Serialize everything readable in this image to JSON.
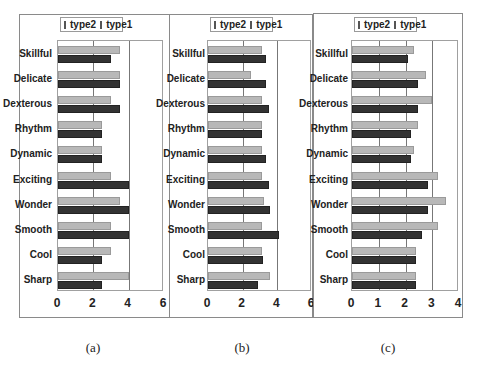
{
  "chart_data": [
    {
      "type": "bar",
      "orientation": "horizontal",
      "caption": "(a)",
      "categories": [
        "Skillful",
        "Delicate",
        "Dexterous",
        "Rhythm",
        "Dynamic",
        "Exciting",
        "Wonder",
        "Smooth",
        "Cool",
        "Sharp"
      ],
      "series": [
        {
          "name": "type2",
          "color": "#333333",
          "values": [
            3.0,
            3.5,
            3.5,
            2.5,
            2.5,
            4.0,
            4.0,
            4.0,
            2.5,
            2.5
          ]
        },
        {
          "name": "type1",
          "color": "#bdbdbd",
          "values": [
            3.5,
            3.5,
            3.0,
            2.5,
            2.5,
            3.0,
            3.5,
            3.0,
            3.0,
            4.0
          ]
        }
      ],
      "xlim": [
        0,
        6
      ],
      "xticks": [
        "0",
        "2",
        "4",
        "6"
      ],
      "legend": [
        "type2",
        "type1"
      ],
      "legend_position": "top",
      "grid": "vertical"
    },
    {
      "type": "bar",
      "orientation": "horizontal",
      "caption": "(b)",
      "categories": [
        "Skillful",
        "Delicate",
        "Dexterous",
        "Rhythm",
        "Dynamic",
        "Exciting",
        "Wonder",
        "Smooth",
        "Cool",
        "Sharp"
      ],
      "series": [
        {
          "name": "type2",
          "color": "#333333",
          "values": [
            3.35,
            3.35,
            3.5,
            3.1,
            3.35,
            3.5,
            3.6,
            4.1,
            3.2,
            2.9
          ]
        },
        {
          "name": "type1",
          "color": "#bdbdbd",
          "values": [
            3.1,
            2.5,
            3.1,
            3.1,
            3.1,
            3.1,
            3.25,
            3.1,
            3.1,
            3.6
          ]
        }
      ],
      "xlim": [
        0,
        6
      ],
      "xticks": [
        "0",
        "2",
        "4",
        "6"
      ],
      "legend": [
        "type2",
        "type1"
      ],
      "legend_position": "top",
      "grid": "vertical"
    },
    {
      "type": "bar",
      "orientation": "horizontal",
      "caption": "(c)",
      "categories": [
        "Skillful",
        "Delicate",
        "Dexterous",
        "Rhythm",
        "Dynamic",
        "Exciting",
        "Wonder",
        "Smooth",
        "Cool",
        "Sharp"
      ],
      "series": [
        {
          "name": "type2",
          "color": "#333333",
          "values": [
            2.1,
            2.45,
            2.45,
            2.2,
            2.2,
            2.85,
            2.85,
            2.6,
            2.4,
            2.4
          ]
        },
        {
          "name": "type1",
          "color": "#bdbdbd",
          "values": [
            2.3,
            2.75,
            3.0,
            2.45,
            2.3,
            3.2,
            3.5,
            3.2,
            2.4,
            2.4
          ]
        }
      ],
      "xlim": [
        0,
        4
      ],
      "xticks": [
        "0",
        "1",
        "2",
        "3",
        "4"
      ],
      "legend": [
        "type2",
        "type1"
      ],
      "legend_position": "top",
      "grid": "vertical"
    }
  ]
}
